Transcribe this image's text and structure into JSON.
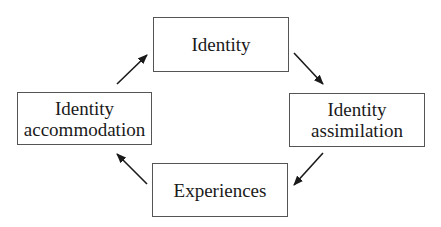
{
  "diagram": {
    "type": "cycle",
    "nodes": [
      {
        "id": "identity",
        "lines": [
          "Identity"
        ]
      },
      {
        "id": "identity_assimilation",
        "lines": [
          "Identity",
          "assimilation"
        ]
      },
      {
        "id": "experiences",
        "lines": [
          "Experiences"
        ]
      },
      {
        "id": "identity_accommodation",
        "lines": [
          "Identity",
          "accommodation"
        ]
      }
    ],
    "edges": [
      {
        "from": "identity",
        "to": "identity_assimilation"
      },
      {
        "from": "identity_assimilation",
        "to": "experiences"
      },
      {
        "from": "experiences",
        "to": "identity_accommodation"
      },
      {
        "from": "identity_accommodation",
        "to": "identity"
      }
    ],
    "colors": {
      "border": "#555555",
      "arrow": "#1a1a1a",
      "text": "#1a1a1a",
      "background": "#ffffff"
    }
  }
}
